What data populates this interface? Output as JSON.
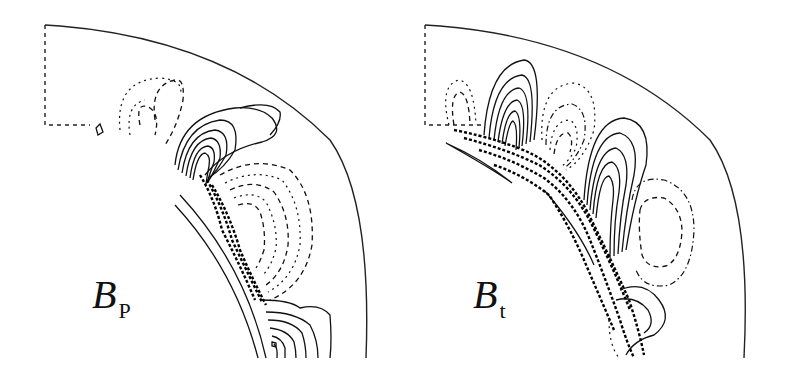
{
  "figure": {
    "background": "#ffffff",
    "line_color": "#111111"
  },
  "panels": [
    {
      "id": "poloidal",
      "label_main": "B",
      "label_sub": "P",
      "meaning": "poloidal field",
      "contour_styles": [
        "solid (positive)",
        "dashed (negative)"
      ]
    },
    {
      "id": "toroidal",
      "label_main": "B",
      "label_sub": "t",
      "meaning": "toroidal field",
      "contour_styles": [
        "solid (positive)",
        "dashed/dotted (negative)"
      ]
    }
  ]
}
